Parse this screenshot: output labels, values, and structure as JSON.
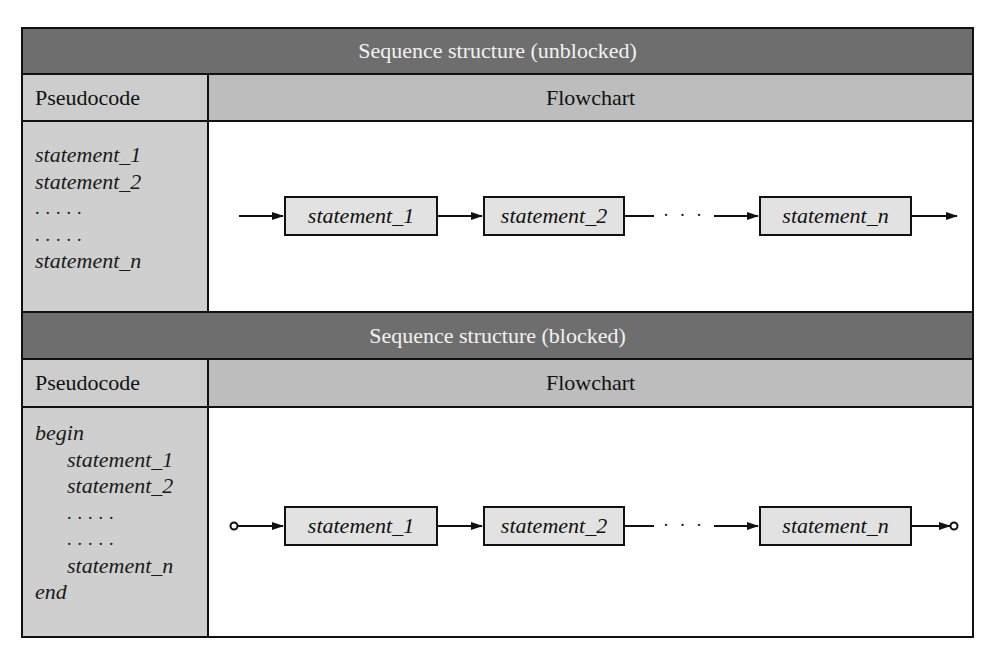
{
  "sections": [
    {
      "title": "Sequence structure (unblocked)",
      "pseudocode_header": "Pseudocode",
      "flowchart_header": "Flowchart",
      "pseudocode_lines": [
        {
          "text": "statement_1",
          "indent": false,
          "kind": "stmt"
        },
        {
          "text": "statement_2",
          "indent": false,
          "kind": "stmt"
        },
        {
          "text": ".....",
          "indent": false,
          "kind": "dots"
        },
        {
          "text": ".....",
          "indent": false,
          "kind": "dots"
        },
        {
          "text": "statement_n",
          "indent": false,
          "kind": "stmt"
        }
      ],
      "flowchart": {
        "boxes": [
          "statement_1",
          "statement_2",
          "statement_n"
        ],
        "ellipsis": "· · ·",
        "terminals": "arrows"
      }
    },
    {
      "title": "Sequence structure (blocked)",
      "pseudocode_header": "Pseudocode",
      "flowchart_header": "Flowchart",
      "pseudocode_lines": [
        {
          "text": "begin",
          "indent": false,
          "kind": "stmt"
        },
        {
          "text": "statement_1",
          "indent": true,
          "kind": "stmt"
        },
        {
          "text": "statement_2",
          "indent": true,
          "kind": "stmt"
        },
        {
          "text": ".....",
          "indent": true,
          "kind": "dots"
        },
        {
          "text": ".....",
          "indent": true,
          "kind": "dots"
        },
        {
          "text": "statement_n",
          "indent": true,
          "kind": "stmt"
        },
        {
          "text": "end",
          "indent": false,
          "kind": "stmt"
        }
      ],
      "flowchart": {
        "boxes": [
          "statement_1",
          "statement_2",
          "statement_n"
        ],
        "ellipsis": "· · ·",
        "terminals": "circles"
      }
    }
  ],
  "colors": {
    "title_band": "#6e6e6e",
    "header_band": "#c4c4c4",
    "pseudocode_bg": "#cfcfcf",
    "box_fill": "#e2e2e2",
    "line": "#111111"
  }
}
